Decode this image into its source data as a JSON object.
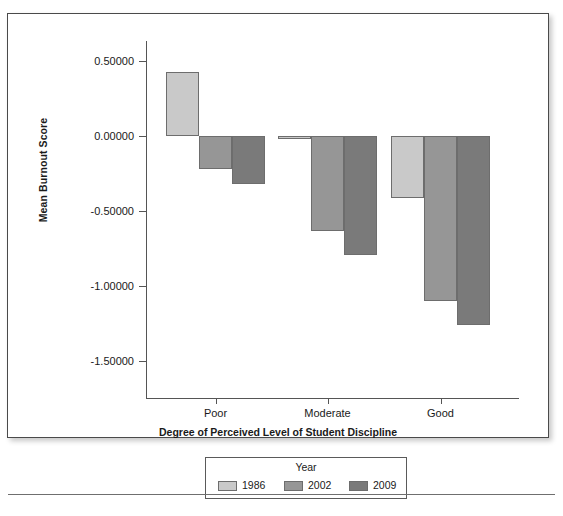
{
  "figure": {
    "has_outer_frame": true,
    "has_page_rule": true
  },
  "chart_data": {
    "type": "bar",
    "title": "",
    "xlabel": "Degree of Perceived Level of Student Discipline",
    "ylabel": "Mean Burnout Score",
    "categories": [
      "Poor",
      "Moderate",
      "Good"
    ],
    "series": [
      {
        "name": "1986",
        "color": "#c9c9c9",
        "values": [
          0.43,
          -0.02,
          -0.41
        ]
      },
      {
        "name": "2002",
        "color": "#969696",
        "values": [
          -0.22,
          -0.63,
          -1.1
        ]
      },
      {
        "name": "2009",
        "color": "#7a7a7a",
        "values": [
          -0.32,
          -0.79,
          -1.26
        ]
      }
    ],
    "legend_title": "Year",
    "legend_position": "bottom",
    "ylim": [
      -1.5,
      0.5
    ],
    "yticks": [
      0.5,
      0.0,
      -0.5,
      -1.0,
      -1.5
    ],
    "ytick_labels": [
      "0.50000",
      "0.00000",
      "-0.50000",
      "-1.00000",
      "-1.50000"
    ],
    "grid": false,
    "bar_border_color": "#6d6d6d"
  }
}
